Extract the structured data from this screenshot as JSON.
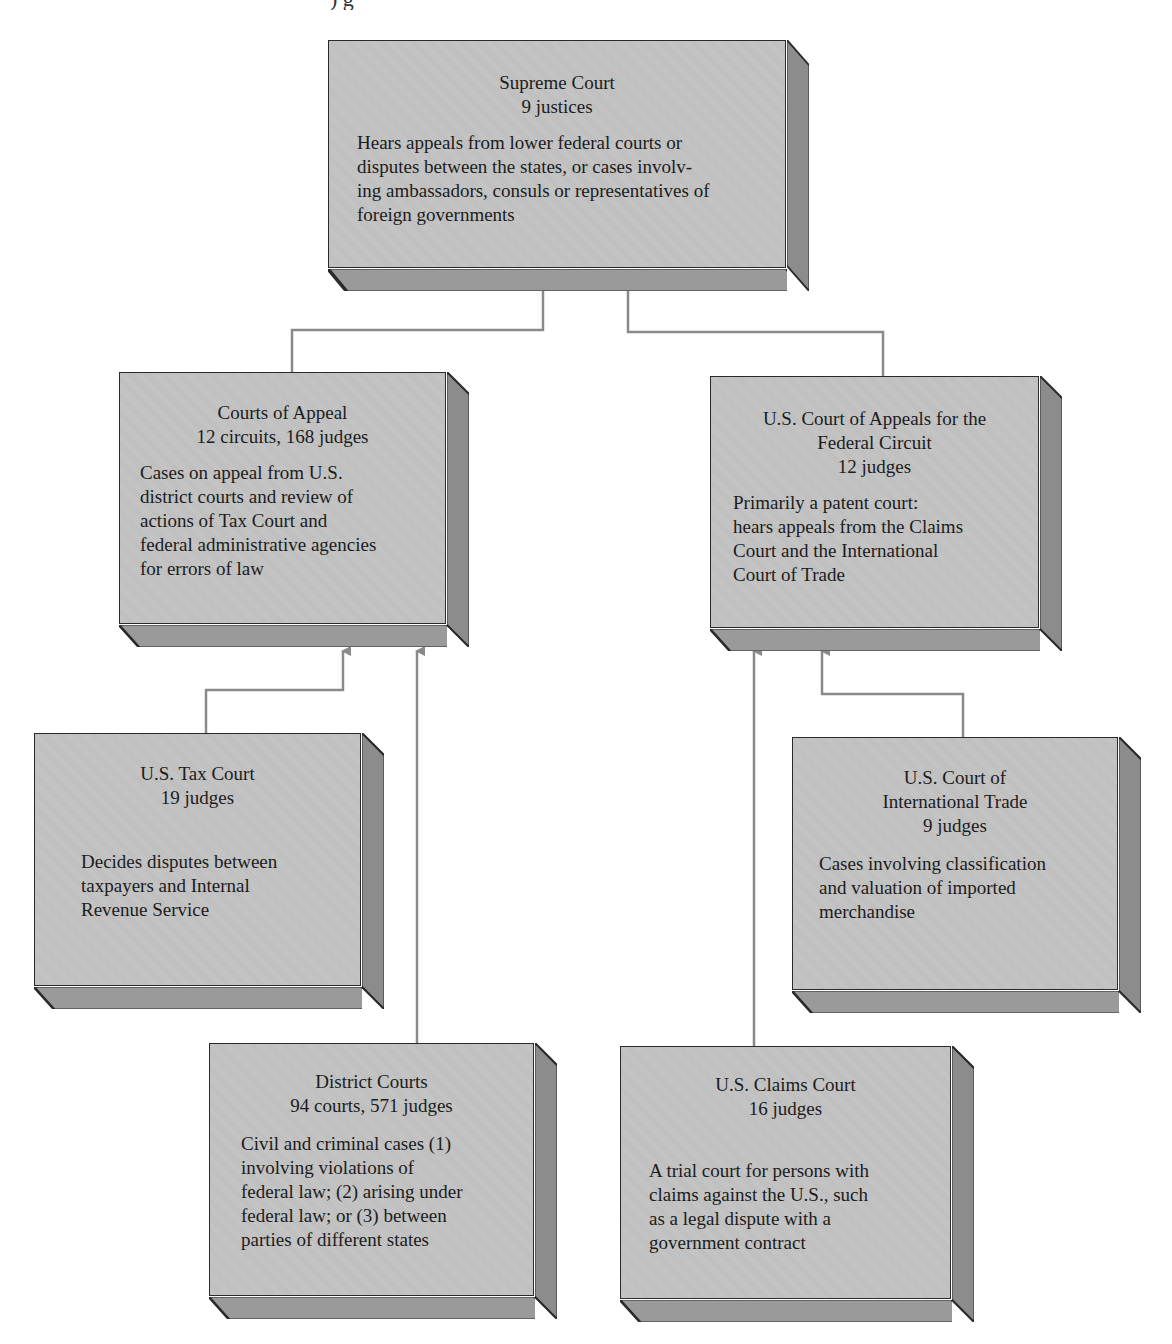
{
  "diagram": {
    "top_fragment": ") g",
    "colors": {
      "box_face": "#c3c3c3",
      "box_side": "#8c8c8c",
      "box_bottom": "#9a9a9a",
      "border": "#2a2a2a",
      "connector": "#8a8a8a"
    },
    "nodes": [
      {
        "id": "supreme",
        "title": "Supreme Court",
        "count": "9 justices",
        "description_lines": [
          "Hears appeals from lower federal courts or",
          "disputes between the states, or cases involv-",
          "ing ambassadors, consuls or representatives of",
          "foreign governments"
        ]
      },
      {
        "id": "appeals",
        "title": "Courts of Appeal",
        "count": "12 circuits, 168 judges",
        "description_lines": [
          "Cases on appeal from U.S.",
          "district courts and review of",
          "actions of Tax Court and",
          "federal administrative agencies",
          "for errors of law"
        ]
      },
      {
        "id": "federal_circuit",
        "title_lines": [
          "U.S. Court of Appeals for the",
          "Federal Circuit"
        ],
        "count": "12 judges",
        "description_lines": [
          "Primarily a patent court:",
          "hears appeals from the Claims",
          "Court and the International",
          "Court of Trade"
        ]
      },
      {
        "id": "tax",
        "title": "U.S. Tax Court",
        "count": "19 judges",
        "description_lines": [
          "Decides disputes between",
          "taxpayers and Internal",
          "Revenue Service"
        ]
      },
      {
        "id": "trade",
        "title_lines": [
          "U.S. Court of",
          "International Trade"
        ],
        "count": "9 judges",
        "description_lines": [
          "Cases involving classification",
          "and valuation of imported",
          "merchandise"
        ]
      },
      {
        "id": "district",
        "title": "District Courts",
        "count": "94 courts, 571 judges",
        "description_lines": [
          "Civil and criminal cases (1)",
          "involving violations of",
          "federal law; (2) arising under",
          "federal law; or (3) between",
          "parties of different states"
        ]
      },
      {
        "id": "claims",
        "title": "U.S. Claims Court",
        "count": "16 judges",
        "description_lines": [
          "A trial court for persons with",
          "claims against the U.S., such",
          "as a legal dispute with a",
          "government contract"
        ]
      }
    ],
    "edges": [
      {
        "from": "appeals",
        "to": "supreme"
      },
      {
        "from": "federal_circuit",
        "to": "supreme"
      },
      {
        "from": "tax",
        "to": "appeals"
      },
      {
        "from": "district",
        "to": "appeals"
      },
      {
        "from": "claims",
        "to": "federal_circuit"
      },
      {
        "from": "trade",
        "to": "federal_circuit"
      }
    ]
  }
}
